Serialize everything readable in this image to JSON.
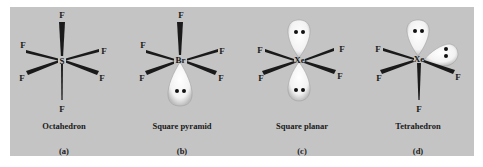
{
  "figure": {
    "background_color": "#c4c4c4",
    "panels": [
      {
        "id": "a",
        "central_atom": "S",
        "ligand": "F",
        "ligand_count": 6,
        "lone_pairs": 0,
        "geometry_name": "Octahedron",
        "label": "(a)"
      },
      {
        "id": "b",
        "central_atom": "Br",
        "ligand": "F",
        "ligand_count": 5,
        "lone_pairs": 1,
        "geometry_name": "Square pyramid",
        "label": "(b)"
      },
      {
        "id": "c",
        "central_atom": "Xe",
        "ligand": "F",
        "ligand_count": 4,
        "lone_pairs": 2,
        "geometry_name": "Square planar",
        "label": "(c)"
      },
      {
        "id": "d",
        "central_atom": "Xe",
        "ligand": "F",
        "ligand_count": 4,
        "lone_pairs": 2,
        "geometry_name": "Tetrahedron",
        "label": "(d)"
      }
    ]
  }
}
